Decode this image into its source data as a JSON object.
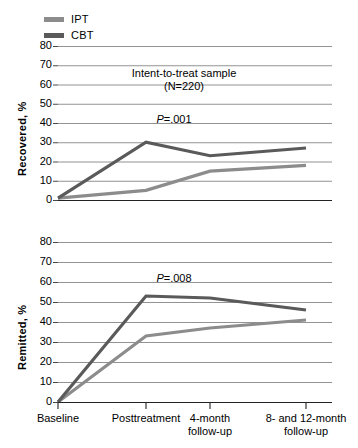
{
  "legend": {
    "items": [
      {
        "label": "IPT",
        "color": "#8c8c8c",
        "icon": "line-swatch-icon"
      },
      {
        "label": "CBT",
        "color": "#5a5a5a",
        "icon": "line-swatch-icon"
      }
    ]
  },
  "axis": {
    "y_ticks": [
      "80",
      "70",
      "60",
      "50",
      "40",
      "30",
      "20",
      "10",
      "0"
    ],
    "x_ticks": [
      "Baseline",
      "Posttreatment",
      "4-month\nfollow-up",
      "8- and 12-month\nfollow-up"
    ],
    "x_tick_lines": [
      {
        "line1": "Baseline",
        "line2": ""
      },
      {
        "line1": "Posttreatment",
        "line2": ""
      },
      {
        "line1": "4-month",
        "line2": "follow-up"
      },
      {
        "line1": "8- and 12-month",
        "line2": "follow-up"
      }
    ]
  },
  "panels": {
    "top": {
      "ylabel": "Recovered, %",
      "title_line1": "Intent-to-treat sample",
      "title_line2": "(N=220)",
      "pvalue_prefix": "P",
      "pvalue_value": "=.001"
    },
    "bottom": {
      "ylabel": "Remitted, %",
      "pvalue_prefix": "P",
      "pvalue_value": "=.008"
    }
  },
  "chart_data": [
    {
      "type": "line",
      "title": "Intent-to-treat sample (N=220)",
      "annotation": "P=.001",
      "xlabel": "",
      "ylabel": "Recovered, %",
      "categories": [
        "Baseline",
        "Posttreatment",
        "4-month follow-up",
        "8- and 12-month follow-up"
      ],
      "ylim": [
        0,
        80
      ],
      "ytick_step": 10,
      "grid": true,
      "legend_position": "top-left",
      "series": [
        {
          "name": "IPT",
          "color": "#8c8c8c",
          "values": [
            1,
            5,
            15,
            18
          ]
        },
        {
          "name": "CBT",
          "color": "#5a5a5a",
          "values": [
            1,
            30,
            23,
            27
          ]
        }
      ]
    },
    {
      "type": "line",
      "title": "",
      "annotation": "P=.008",
      "xlabel": "",
      "ylabel": "Remitted, %",
      "categories": [
        "Baseline",
        "Posttreatment",
        "4-month follow-up",
        "8- and 12-month follow-up"
      ],
      "ylim": [
        0,
        80
      ],
      "ytick_step": 10,
      "grid": true,
      "legend_position": "top-left",
      "series": [
        {
          "name": "IPT",
          "color": "#8c8c8c",
          "values": [
            0,
            33,
            37,
            41
          ]
        },
        {
          "name": "CBT",
          "color": "#5a5a5a",
          "values": [
            0,
            53,
            52,
            46
          ]
        }
      ]
    }
  ]
}
